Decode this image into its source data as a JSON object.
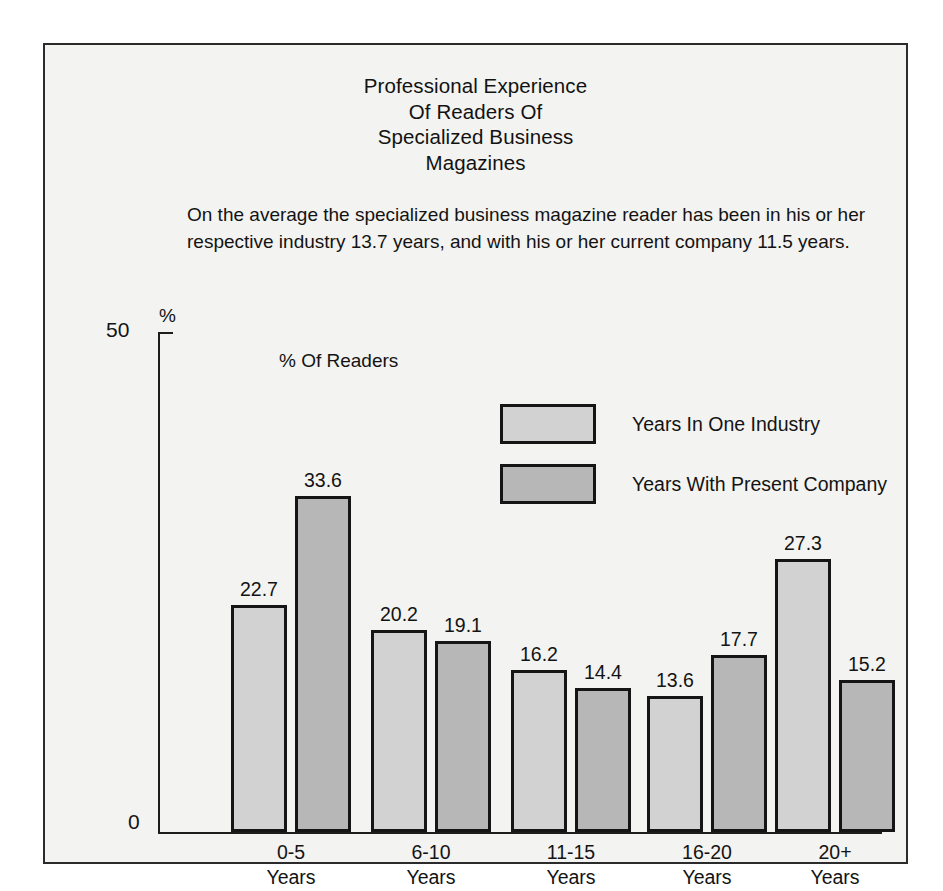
{
  "chart_data": {
    "type": "bar",
    "title": "Professional Experience\nOf Readers Of\nSpecialized Business\nMagazines",
    "title_lines": [
      "Professional Experience",
      "Of Readers Of",
      "Specialized Business",
      "Magazines"
    ],
    "subtitle": "On the average the specialized business magazine reader has been in his or her respective industry 13.7 years, and with his or her current company 11.5 years.",
    "axis_note": "% Of Readers",
    "ylabel": "%",
    "xlabel": "",
    "ylim": [
      0,
      50
    ],
    "ytick_labels": [
      "0",
      "50"
    ],
    "grid": false,
    "legend_position": "upper-center",
    "categories": [
      "0-5\nYears",
      "6-10\nYears",
      "11-15\nYears",
      "16-20\nYears",
      "20+\nYears"
    ],
    "category_lines": [
      [
        "0-5",
        "Years"
      ],
      [
        "6-10",
        "Years"
      ],
      [
        "11-15",
        "Years"
      ],
      [
        "16-20",
        "Years"
      ],
      [
        "20+",
        "Years"
      ]
    ],
    "series": [
      {
        "name": "Years In One Industry",
        "color": "#d2d2d2",
        "values": [
          22.7,
          20.2,
          16.2,
          13.6,
          27.3
        ]
      },
      {
        "name": "Years With Present Company",
        "color": "#b7b7b7",
        "values": [
          33.6,
          19.1,
          14.4,
          17.7,
          15.2
        ]
      }
    ]
  },
  "colors": {
    "frame_border": "#2b2b2b",
    "page_background": "#f3f3f1",
    "bar_outline": "#151515",
    "text": "#131313",
    "series_1": "#d2d2d2",
    "series_2": "#b7b7b7"
  }
}
